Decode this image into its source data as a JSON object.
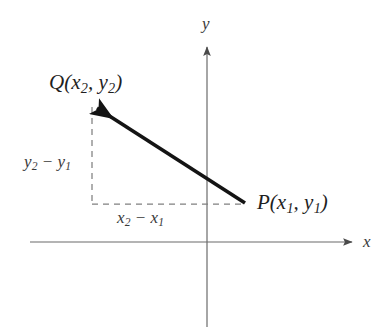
{
  "figure": {
    "name": "coordinate-plane-vector-diagram",
    "background_color": "#ffffff",
    "width": 390,
    "height": 332
  },
  "axes": {
    "x_axis_label": "x",
    "y_axis_label": "y",
    "axis_color": "#6b6b6b",
    "x_axis": {
      "y": 242,
      "x_start": 30,
      "x_end": 355,
      "arrow": "right"
    },
    "y_axis": {
      "x": 207,
      "y_start": 45,
      "y_end": 327,
      "arrow": "up"
    },
    "origin": {
      "x": 207,
      "y": 242
    }
  },
  "points": {
    "q": {
      "label": "Q(x2, y2)",
      "label_base": "Q(x",
      "sub_1": "2",
      "mid": ", y",
      "sub_2": "2",
      "close": ")",
      "position": {
        "x": 92,
        "y": 105
      }
    },
    "p": {
      "label": "P(x1, y1)",
      "label_base": "P(x",
      "sub_1": "1",
      "mid": ", y",
      "sub_2": "1",
      "close": ")",
      "position": {
        "x": 245,
        "y": 204
      }
    }
  },
  "vector": {
    "name": "vector-p-to-q",
    "from": {
      "x": 245,
      "y": 203
    },
    "to": {
      "x": 91,
      "y": 104
    },
    "color": "#141414",
    "stroke_width": 3.6,
    "arrowhead_at": "q"
  },
  "legs": {
    "horizontal": {
      "label_base": "x",
      "sub_1": "2",
      "minus": " − x",
      "sub_2": "1",
      "label": "x2 - x1",
      "line": {
        "x_start": 92,
        "x_end": 245,
        "y": 204
      },
      "style": "dashed",
      "color": "#7a7a7a"
    },
    "vertical": {
      "label_base": "y",
      "sub_1": "2",
      "minus": " − y",
      "sub_2": "1",
      "label": "y2 - y1",
      "line": {
        "x": 92,
        "y_start": 107,
        "y_end": 204
      },
      "style": "dashed",
      "color": "#7a7a7a"
    }
  }
}
